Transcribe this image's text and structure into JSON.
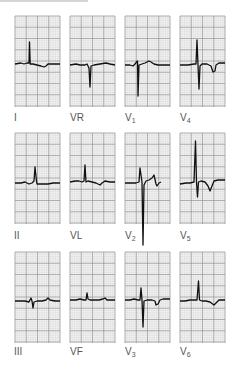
{
  "figure": {
    "grid": {
      "minor_color": "#d0d0d0",
      "major_color": "#8a8a8a",
      "bg": "#f3f3f3",
      "trace_color": "#111111"
    },
    "leads": [
      {
        "id": "I",
        "lead": "I",
        "sub": "",
        "x": 15,
        "y": 16,
        "lx": 14,
        "ly": 113,
        "trace": "0,48 6,47 9,48 12,47 14,47 14.5,26 15.2,48 18,48 22,49 26,50 29,51 31,50 33,48 38,48 45,48"
      },
      {
        "id": "VR",
        "lead": "VR",
        "sub": "",
        "x": 70,
        "y": 16,
        "lx": 70,
        "ly": 113,
        "trace": "0,49 6,48 10,49 15,49 17,48 19,52 20,71 21,50 24,49 30,48 36,47 40,48 45,49"
      },
      {
        "id": "V1",
        "lead": "V",
        "sub": "1",
        "x": 125,
        "y": 16,
        "lx": 125,
        "ly": 113,
        "trace": "0,49 5,49 8,50 10,48 11.5,46 12.5,45 13,80 14,49 17,48 20,47 24,45 26,46 29,48 33,49 45,49"
      },
      {
        "id": "V4",
        "lead": "V",
        "sub": "4",
        "x": 180,
        "y": 16,
        "lx": 180,
        "ly": 113,
        "trace": "0,49 8,49 14,48 16,48 17,24 18,49 19,73 20,50 22,48 27,48 31,50 33,56 35,55 36,49 39,47 45,47"
      },
      {
        "id": "II",
        "lead": "II",
        "sub": "",
        "x": 15,
        "y": 133,
        "lx": 14,
        "ly": 231,
        "trace": "0,50 6,50 10,49 14,51 17,50 19,48 20,34 21.5,48 22,51 27,51 33,51 38,50 45,50"
      },
      {
        "id": "VL",
        "lead": "VL",
        "sub": "",
        "x": 70,
        "y": 133,
        "lx": 70,
        "ly": 231,
        "trace": "0,49 5,48 9,48 12,49 14,48 15,32 16,49 18,48 22,49 26,50 30,52 32,50 35,48 40,49 45,49"
      },
      {
        "id": "V2",
        "lead": "V",
        "sub": "2",
        "x": 125,
        "y": 133,
        "lx": 125,
        "ly": 231,
        "trace": "0,50 6,50 11,50 14,49 15,35 17,49 18,112 19,52 21,48 24,47 27,45 29,42 31,51 32,53 34,50 36,49"
      },
      {
        "id": "V5",
        "lead": "V",
        "sub": "5",
        "x": 180,
        "y": 133,
        "lx": 180,
        "ly": 231,
        "trace": "0,51 6,50 10,50 14,49 15.5,8 16.5,49 17.5,64 18.5,49 21,48 25,49 28,53 30,58 32,53 34,48 38,47 45,47"
      },
      {
        "id": "III",
        "lead": "III",
        "sub": "",
        "x": 15,
        "y": 252,
        "lx": 14,
        "ly": 347,
        "trace": "0,49 6,49 10,49 14,50 16,46 17,49 18,56 19,50 22,49 27,49 31,48 33,46 35,48 40,49 45,49"
      },
      {
        "id": "VF",
        "lead": "VF",
        "sub": "",
        "x": 70,
        "y": 252,
        "lx": 70,
        "ly": 347,
        "trace": "0,48 6,48 10,47 14,48 16,48 17,41 18,47 20,48 25,48 29,48 33,47 35,46 37,48 42,48 45,48"
      },
      {
        "id": "V3",
        "lead": "V",
        "sub": "3",
        "x": 125,
        "y": 252,
        "lx": 125,
        "ly": 347,
        "trace": "0,48 5,48 9,47 13,48 15,48 16,36 17,48 18,75 19,49 22,48 27,48 30,49 31,53 33,52 35,48 38,47 45,47"
      },
      {
        "id": "V6",
        "lead": "V",
        "sub": "6",
        "x": 180,
        "y": 252,
        "lx": 180,
        "ly": 347,
        "trace": "0,49 5,49 10,48 15,48 17,48 18.5,29 19.5,48 22,49 26,49 30,50 34,53 36,51 39,48 45,48"
      }
    ]
  }
}
